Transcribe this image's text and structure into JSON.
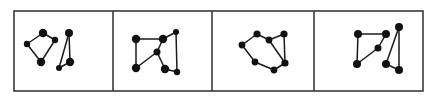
{
  "figure": {
    "type": "sequence-of-panels",
    "panel_count": 4,
    "colors": {
      "background": "#ffffff",
      "border": "#3a3a3a",
      "edge": "#1a1a1a",
      "node": "#111111"
    },
    "frame": {
      "x": 14,
      "y": 11,
      "width": 409,
      "height": 80
    },
    "separators_x": [
      113,
      212,
      314
    ],
    "panels": [
      {
        "index": 1,
        "nodes": [
          {
            "x": 27,
            "y": 44,
            "r": 3.2
          },
          {
            "x": 43,
            "y": 33,
            "r": 4.2
          },
          {
            "x": 55,
            "y": 40,
            "r": 3.2
          },
          {
            "x": 41,
            "y": 62,
            "r": 4.2
          },
          {
            "x": 69,
            "y": 33,
            "r": 4.0
          },
          {
            "x": 70,
            "y": 62,
            "r": 4.2
          },
          {
            "x": 59,
            "y": 68,
            "r": 3.0
          }
        ],
        "edges": [
          [
            0,
            1
          ],
          [
            1,
            2
          ],
          [
            2,
            3
          ],
          [
            3,
            0
          ],
          [
            4,
            5
          ],
          [
            5,
            6
          ],
          [
            6,
            4
          ]
        ]
      },
      {
        "index": 2,
        "nodes": [
          {
            "x": 136,
            "y": 39,
            "r": 4.2
          },
          {
            "x": 163,
            "y": 39,
            "r": 4.2
          },
          {
            "x": 176,
            "y": 32,
            "r": 3.0
          },
          {
            "x": 157,
            "y": 52,
            "r": 3.5
          },
          {
            "x": 136,
            "y": 68,
            "r": 4.2
          },
          {
            "x": 165,
            "y": 69,
            "r": 4.2
          },
          {
            "x": 177,
            "y": 72,
            "r": 3.2
          }
        ],
        "edges": [
          [
            0,
            1
          ],
          [
            1,
            2
          ],
          [
            2,
            6
          ],
          [
            6,
            5
          ],
          [
            5,
            3
          ],
          [
            3,
            4
          ],
          [
            4,
            0
          ],
          [
            3,
            1
          ]
        ]
      },
      {
        "index": 3,
        "nodes": [
          {
            "x": 242,
            "y": 45,
            "r": 3.4
          },
          {
            "x": 257,
            "y": 34,
            "r": 3.6
          },
          {
            "x": 269,
            "y": 40,
            "r": 3.4
          },
          {
            "x": 284,
            "y": 34,
            "r": 3.6
          },
          {
            "x": 285,
            "y": 63,
            "r": 3.6
          },
          {
            "x": 274,
            "y": 70,
            "r": 3.4
          },
          {
            "x": 255,
            "y": 62,
            "r": 3.4
          }
        ],
        "edges": [
          [
            0,
            1
          ],
          [
            1,
            2
          ],
          [
            2,
            3
          ],
          [
            3,
            4
          ],
          [
            4,
            5
          ],
          [
            5,
            6
          ],
          [
            6,
            0
          ],
          [
            2,
            4
          ]
        ]
      },
      {
        "index": 4,
        "nodes": [
          {
            "x": 358,
            "y": 34,
            "r": 4.0
          },
          {
            "x": 386,
            "y": 34,
            "r": 4.0
          },
          {
            "x": 378,
            "y": 48,
            "r": 3.5
          },
          {
            "x": 357,
            "y": 64,
            "r": 4.0
          },
          {
            "x": 399,
            "y": 27,
            "r": 4.0
          },
          {
            "x": 386,
            "y": 64,
            "r": 4.0
          },
          {
            "x": 399,
            "y": 70,
            "r": 4.0
          }
        ],
        "edges": [
          [
            0,
            1
          ],
          [
            1,
            2
          ],
          [
            2,
            3
          ],
          [
            3,
            0
          ],
          [
            4,
            5
          ],
          [
            5,
            6
          ],
          [
            6,
            4
          ]
        ]
      }
    ]
  }
}
